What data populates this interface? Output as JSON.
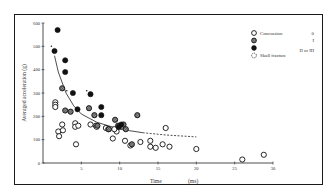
{
  "chart_data": {
    "type": "scatter",
    "title": "",
    "xlabel": "Time (ms)",
    "xlabel_parts": [
      "Time",
      "(ms)"
    ],
    "ylabel": "Averaged acceleration (g)",
    "xlim": [
      0,
      30
    ],
    "ylim": [
      0,
      600
    ],
    "x_ticks": [
      0,
      5,
      10,
      15,
      20,
      25,
      30
    ],
    "x_tick_labels": [
      "0",
      "5",
      "10",
      "15",
      "20",
      "25",
      "30"
    ],
    "y_ticks": [
      0,
      100,
      200,
      300,
      400,
      500,
      600
    ],
    "y_tick_labels": [
      "0",
      "100",
      "200",
      "300",
      "400",
      "500",
      "600"
    ],
    "grid": false,
    "legend_position": "upper right",
    "legend": [
      {
        "marker": "open-circle",
        "label": "Concussion",
        "grade": "0"
      },
      {
        "marker": "hatched-circle",
        "label": "",
        "grade": "I"
      },
      {
        "marker": "filled-circle",
        "label": "",
        "grade": "II or III"
      },
      {
        "marker": "dotted-circle",
        "label": "Skull fracture",
        "grade": ""
      }
    ],
    "series": [
      {
        "name": "Concussion grade 0",
        "marker": "open-circle",
        "points": [
          [
            1.6,
            260
          ],
          [
            1.6,
            250
          ],
          [
            1.6,
            240
          ],
          [
            2.0,
            135
          ],
          [
            2.1,
            115
          ],
          [
            2.5,
            165
          ],
          [
            2.6,
            140
          ],
          [
            4.2,
            170
          ],
          [
            4.2,
            155
          ],
          [
            4.6,
            160
          ],
          [
            4.3,
            80
          ],
          [
            6.2,
            165
          ],
          [
            6.9,
            160
          ],
          [
            7.0,
            155
          ],
          [
            8.2,
            150
          ],
          [
            8.5,
            145
          ],
          [
            9.1,
            105
          ],
          [
            9.6,
            135
          ],
          [
            10.7,
            95
          ],
          [
            11.4,
            75
          ],
          [
            12.7,
            90
          ],
          [
            14.0,
            95
          ],
          [
            14.0,
            70
          ],
          [
            14.7,
            65
          ],
          [
            15.6,
            80
          ],
          [
            16.0,
            150
          ],
          [
            16.5,
            70
          ],
          [
            20.0,
            60
          ],
          [
            26.0,
            15
          ],
          [
            28.8,
            35
          ],
          [
            9.3,
            145
          ],
          [
            10.3,
            160
          ]
        ]
      },
      {
        "name": "Concussion grade I",
        "marker": "hatched-circle",
        "points": [
          [
            2.5,
            320
          ],
          [
            2.9,
            225
          ],
          [
            3.6,
            220
          ],
          [
            6.0,
            235
          ],
          [
            6.7,
            205
          ],
          [
            7.1,
            160
          ],
          [
            8.6,
            145
          ],
          [
            9.4,
            185
          ],
          [
            9.8,
            160
          ],
          [
            10.5,
            165
          ],
          [
            10.8,
            145
          ],
          [
            11.6,
            80
          ],
          [
            12.3,
            205
          ]
        ]
      },
      {
        "name": "Concussion grade II or III",
        "marker": "filled-circle",
        "points": [
          [
            1.9,
            570
          ],
          [
            1.5,
            480
          ],
          [
            2.9,
            440
          ],
          [
            2.9,
            390
          ],
          [
            3.9,
            300
          ],
          [
            4.5,
            230
          ],
          [
            6.2,
            295
          ],
          [
            7.6,
            240
          ],
          [
            7.6,
            205
          ],
          [
            9.9,
            155
          ],
          [
            10.2,
            165
          ]
        ]
      },
      {
        "name": "Tolerance curve",
        "type": "line",
        "style": "solid then dashed",
        "points": [
          [
            1.5,
            460
          ],
          [
            2,
            390
          ],
          [
            3,
            300
          ],
          [
            4,
            245
          ],
          [
            5,
            210
          ],
          [
            7,
            175
          ],
          [
            10,
            145
          ],
          [
            13,
            130
          ],
          [
            16,
            120
          ],
          [
            20,
            112
          ]
        ],
        "dashed_from_x": 13
      }
    ],
    "skull_fracture_marked": [
      [
        1.1,
        500
      ],
      [
        3.1,
        310
      ],
      [
        5.7,
        310
      ]
    ]
  }
}
